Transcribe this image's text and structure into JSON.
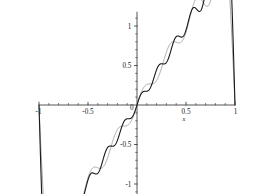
{
  "chart_data": {
    "type": "line",
    "title": "",
    "subtitle": "",
    "xlabel": "x",
    "ylabel": "",
    "xlim": [
      -1.0,
      1.0
    ],
    "ylim": [
      -1.18,
      1.18
    ],
    "grid": false,
    "legend": "none",
    "background_color": "#ffffff",
    "axis_color": "#2b2b2b",
    "xticks": [
      -1,
      -0.5,
      0,
      0.5,
      1
    ],
    "xticklabels": [
      "-1",
      "-0.5",
      "0",
      "0.5",
      "1"
    ],
    "yticks": [
      -1,
      -0.5,
      0.5,
      1
    ],
    "yticklabels": [
      "-1",
      "-0.5",
      "0.5",
      "1"
    ],
    "x_minor_tick_step": 0.1,
    "y_minor_tick_step": 0.1,
    "annotations": [],
    "series": [
      {
        "name": "partial-sum-low-order",
        "color": "#9a9a9a",
        "width": 0.9,
        "harmonics": 7,
        "amplitude_scale": 0.6366,
        "function": "sawtooth partial sum, fewer terms",
        "x": [
          -1.0,
          -0.98,
          -0.96,
          -0.94,
          -0.92,
          -0.9,
          -0.88,
          -0.86,
          -0.84,
          -0.82,
          -0.8,
          -0.78,
          -0.76,
          -0.74,
          -0.72,
          -0.7,
          -0.68,
          -0.66,
          -0.64,
          -0.62,
          -0.6,
          -0.58,
          -0.56,
          -0.54,
          -0.52,
          -0.5,
          -0.48,
          -0.46,
          -0.44,
          -0.42,
          -0.4,
          -0.38,
          -0.36,
          -0.34,
          -0.32,
          -0.3,
          -0.28,
          -0.26,
          -0.24,
          -0.22,
          -0.2,
          -0.18,
          -0.16,
          -0.14,
          -0.12,
          -0.1,
          -0.08,
          -0.06,
          -0.04,
          -0.02,
          0.0,
          0.02,
          0.04,
          0.06,
          0.08,
          0.1,
          0.12,
          0.14,
          0.16,
          0.18,
          0.2,
          0.22,
          0.24,
          0.26,
          0.28,
          0.3,
          0.32,
          0.34,
          0.36,
          0.38,
          0.4,
          0.42,
          0.44,
          0.46,
          0.48,
          0.5,
          0.52,
          0.54,
          0.56,
          0.58,
          0.6,
          0.62,
          0.64,
          0.66,
          0.68,
          0.7,
          0.72,
          0.74,
          0.76,
          0.78,
          0.8,
          0.82,
          0.84,
          0.86,
          0.88,
          0.9,
          0.92,
          0.94,
          0.96,
          0.98,
          1.0
        ]
      },
      {
        "name": "partial-sum-high-order",
        "color": "#1a1a1a",
        "width": 1.1,
        "harmonics": 11,
        "amplitude_scale": 0.6366,
        "function": "sawtooth partial sum, more terms",
        "x": [
          -1.0,
          -0.98,
          -0.96,
          -0.94,
          -0.92,
          -0.9,
          -0.88,
          -0.86,
          -0.84,
          -0.82,
          -0.8,
          -0.78,
          -0.76,
          -0.74,
          -0.72,
          -0.7,
          -0.68,
          -0.66,
          -0.64,
          -0.62,
          -0.6,
          -0.58,
          -0.56,
          -0.54,
          -0.52,
          -0.5,
          -0.48,
          -0.46,
          -0.44,
          -0.42,
          -0.4,
          -0.38,
          -0.36,
          -0.34,
          -0.32,
          -0.3,
          -0.28,
          -0.26,
          -0.24,
          -0.22,
          -0.2,
          -0.18,
          -0.16,
          -0.14,
          -0.12,
          -0.1,
          -0.08,
          -0.06,
          -0.04,
          -0.02,
          0.0,
          0.02,
          0.04,
          0.06,
          0.08,
          0.1,
          0.12,
          0.14,
          0.16,
          0.18,
          0.2,
          0.22,
          0.24,
          0.26,
          0.28,
          0.3,
          0.32,
          0.34,
          0.36,
          0.38,
          0.4,
          0.42,
          0.44,
          0.46,
          0.48,
          0.5,
          0.52,
          0.54,
          0.56,
          0.58,
          0.6,
          0.62,
          0.64,
          0.66,
          0.68,
          0.7,
          0.72,
          0.74,
          0.76,
          0.78,
          0.8,
          0.82,
          0.84,
          0.86,
          0.88,
          0.9,
          0.92,
          0.94,
          0.96,
          0.98,
          1.0
        ]
      }
    ]
  }
}
